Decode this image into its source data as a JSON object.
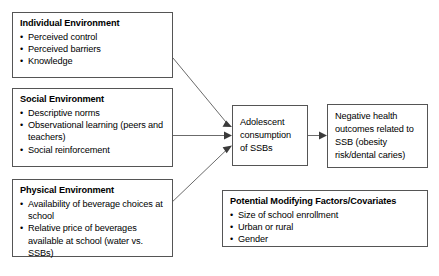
{
  "diagram": {
    "boxes": {
      "individual_environment": {
        "title": "Individual Environment",
        "items": [
          "Perceived control",
          "Perceived barriers",
          "Knowledge"
        ]
      },
      "social_environment": {
        "title": "Social Environment",
        "items": [
          "Descriptive norms",
          "Observational learning (peers and teachers)",
          "Social reinforcement"
        ]
      },
      "physical_environment": {
        "title": "Physical Environment",
        "items": [
          "Availability of beverage choices at school",
          "Relative price of beverages available at school (water vs. SSBs)"
        ]
      },
      "consumption": {
        "text": "Adolescent consumption of SSBs"
      },
      "outcomes": {
        "text": "Negative health outcomes related to SSB (obesity risk/dental caries)"
      },
      "covariates": {
        "title": "Potential Modifying Factors/Covariates",
        "items": [
          "Size of school enrollment",
          "Urban or rural",
          "Gender"
        ]
      }
    },
    "connectors": [
      {
        "name": "individual-to-consumption",
        "type": "arrow-diagonal-down"
      },
      {
        "name": "social-to-consumption",
        "type": "arrow-horizontal"
      },
      {
        "name": "physical-to-consumption",
        "type": "arrow-diagonal-up"
      },
      {
        "name": "consumption-to-outcomes",
        "type": "arrow-horizontal"
      }
    ],
    "colors": {
      "box_border": "#555555",
      "connector": "#6b6b6b",
      "arrowhead": "#3a3a3a",
      "text": "#000000",
      "background": "#ffffff"
    }
  }
}
